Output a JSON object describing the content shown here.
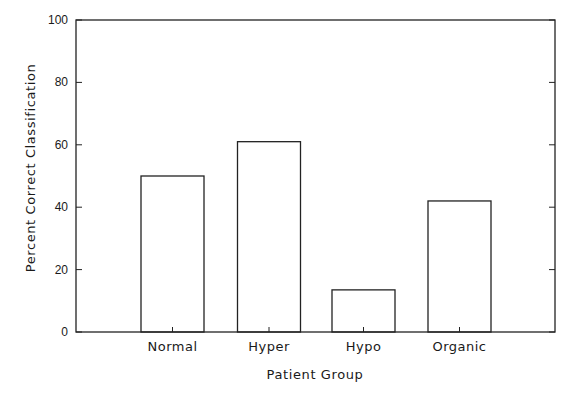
{
  "chart_data": {
    "type": "bar",
    "title": "",
    "xlabel": "Patient Group",
    "ylabel": "Percent Correct Classification",
    "categories": [
      "Normal",
      "Hyper",
      "Hypo",
      "Organic"
    ],
    "values": [
      50,
      61,
      13.5,
      42
    ],
    "ylim": [
      0,
      100
    ],
    "yticks": [
      0,
      20,
      40,
      60,
      80,
      100
    ],
    "ytick_labels": [
      "0",
      "20",
      "40",
      "60",
      "80",
      "100"
    ],
    "grid": false,
    "legend": "none",
    "bar_style": "outline"
  }
}
